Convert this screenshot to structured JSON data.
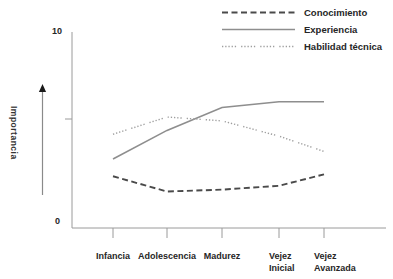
{
  "chart_data": {
    "type": "line",
    "title": "",
    "xlabel": "",
    "ylabel": "Importancia",
    "ylim": [
      0,
      10
    ],
    "ytick_labels": {
      "max": "10",
      "min": "0"
    },
    "ytick_values": [
      0,
      5,
      10
    ],
    "grid": false,
    "legend_position": "top-right",
    "categories": [
      "Infancia",
      "Adolescencia",
      "Madurez",
      "Vejez\nInicial",
      "Vejez\nAvanzada"
    ],
    "series": [
      {
        "name": "Conocimiento",
        "style": "dashed",
        "color": "#4a4a4a",
        "values": [
          2.5,
          1.7,
          1.8,
          2.0,
          2.6
        ]
      },
      {
        "name": "Experiencia",
        "style": "solid",
        "color": "#8e8e8e",
        "values": [
          3.4,
          4.9,
          6.1,
          6.4,
          6.4
        ]
      },
      {
        "name": "Habilidad técnica",
        "style": "dotted",
        "color": "#9e9e9e",
        "values": [
          4.7,
          5.6,
          5.4,
          4.6,
          3.8
        ]
      }
    ]
  },
  "axis": {
    "ymax_label": "10",
    "ymin_label": "0",
    "axis_color": "#9a9a9a",
    "arrow_color": "#1a1a1a"
  }
}
